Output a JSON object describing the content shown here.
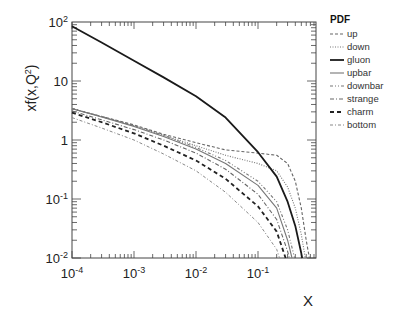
{
  "chart_data": {
    "type": "line",
    "title": "",
    "xlabel": "X",
    "ylabel": "xf(x,Q²)",
    "xscale": "log",
    "yscale": "log",
    "xlim": [
      0.0001,
      0.85
    ],
    "ylim": [
      0.01,
      100
    ],
    "xticks": [
      "10⁻⁴",
      "10⁻³",
      "10⁻²",
      "10⁻¹"
    ],
    "yticks": [
      "10⁻²",
      "10⁻¹",
      "1",
      "10",
      "10²"
    ],
    "grid": false,
    "legend": {
      "title": "PDF",
      "position": "right-outside-top"
    },
    "x": [
      0.0001,
      0.0003,
      0.001,
      0.003,
      0.01,
      0.03,
      0.1,
      0.2,
      0.3,
      0.4,
      0.5,
      0.6,
      0.7
    ],
    "series": [
      {
        "name": "up",
        "style": "dashed-fine",
        "values": [
          3.4,
          2.5,
          1.8,
          1.25,
          0.9,
          0.68,
          0.6,
          0.55,
          0.4,
          0.2,
          0.07,
          0.02,
          0.008
        ]
      },
      {
        "name": "down",
        "style": "dotted",
        "values": [
          3.4,
          2.5,
          1.75,
          1.2,
          0.8,
          0.55,
          0.4,
          0.3,
          0.16,
          0.07,
          0.025,
          0.008,
          0.003
        ]
      },
      {
        "name": "gluon",
        "style": "solid-thick",
        "values": [
          85,
          45,
          22,
          11.5,
          5.5,
          2.4,
          0.62,
          0.24,
          0.09,
          0.035,
          0.012,
          0.004,
          0.001
        ]
      },
      {
        "name": "upbar",
        "style": "solid-thin",
        "values": [
          3.4,
          2.45,
          1.7,
          1.15,
          0.7,
          0.4,
          0.17,
          0.07,
          0.02,
          0.006,
          0.002,
          0.0006,
          0.0002
        ]
      },
      {
        "name": "downbar",
        "style": "dash-dot-dot",
        "values": [
          3.4,
          2.5,
          1.75,
          1.2,
          0.75,
          0.45,
          0.2,
          0.09,
          0.03,
          0.009,
          0.003,
          0.001,
          0.0003
        ]
      },
      {
        "name": "strange",
        "style": "dash-dot",
        "values": [
          3.1,
          2.2,
          1.5,
          1.0,
          0.6,
          0.32,
          0.12,
          0.045,
          0.013,
          0.004,
          0.001,
          0.0003,
          0.0001
        ]
      },
      {
        "name": "charm",
        "style": "dashed-thick",
        "values": [
          2.9,
          2.0,
          1.3,
          0.8,
          0.45,
          0.22,
          0.075,
          0.028,
          0.008,
          0.002,
          0.0006,
          0.0002,
          0.0001
        ]
      },
      {
        "name": "bottom",
        "style": "dash-dot-fine",
        "values": [
          2.4,
          1.6,
          1.0,
          0.58,
          0.3,
          0.13,
          0.04,
          0.014,
          0.004,
          0.001,
          0.0003,
          0.0001,
          5e-05
        ]
      }
    ]
  },
  "plot_px": {
    "left": 72,
    "right": 316,
    "top": 22,
    "bottom": 258,
    "xdecade": 62,
    "ydecade": 59
  },
  "legend_items": [
    {
      "name": "up",
      "dash": "3,2",
      "width": 1.1,
      "color": "#666666"
    },
    {
      "name": "down",
      "dash": "1,1.5",
      "width": 1.1,
      "color": "#777777"
    },
    {
      "name": "gluon",
      "dash": "",
      "width": 1.8,
      "color": "#1a1a1a"
    },
    {
      "name": "upbar",
      "dash": "",
      "width": 1.1,
      "color": "#777777"
    },
    {
      "name": "downbar",
      "dash": "3,2,1,2,1,2",
      "width": 1.1,
      "color": "#777777"
    },
    {
      "name": "strange",
      "dash": "4,2,1,2",
      "width": 1.1,
      "color": "#666666"
    },
    {
      "name": "charm",
      "dash": "4,3",
      "width": 1.8,
      "color": "#222222"
    },
    {
      "name": "bottom",
      "dash": "3,2,1,2",
      "width": 1.0,
      "color": "#888888"
    }
  ]
}
